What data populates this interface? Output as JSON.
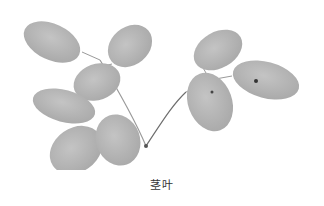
{
  "figure": {
    "style": "grayscale photograph",
    "leaf_color": "#b9b9b9",
    "leaf_shade": "#a8a8a8",
    "stem_color": "#8a8a8a"
  },
  "caption": "茎叶"
}
